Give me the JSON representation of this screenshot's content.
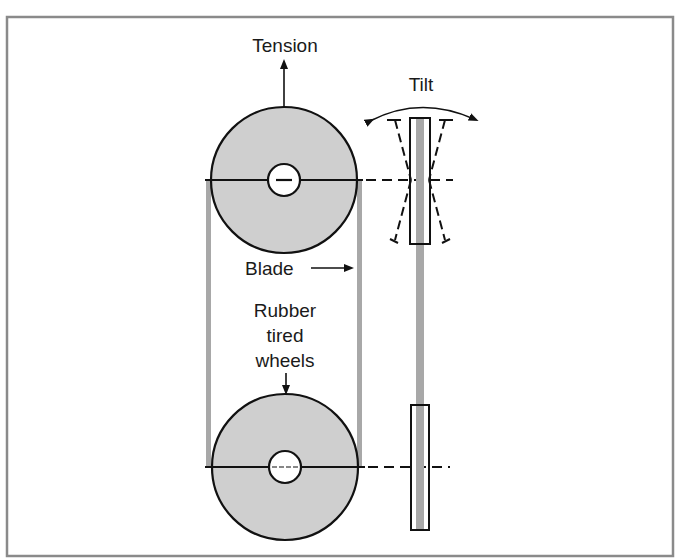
{
  "diagram": {
    "labels": {
      "tension": "Tension",
      "tilt": "Tilt",
      "blade": "Blade",
      "wheels_line1": "Rubber",
      "wheels_line2": "tired",
      "wheels_line3": "wheels"
    },
    "colors": {
      "frame": "#8a8a8a",
      "wheel_fill": "#cfcfcf",
      "blade": "#a8a8a8",
      "stroke": "#111111"
    }
  }
}
